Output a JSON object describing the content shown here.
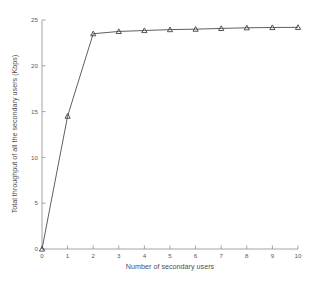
{
  "chart_data": {
    "type": "line",
    "title": "",
    "xlabel": "Number of secondary users",
    "ylabel": "Total throughput of all the secondary users (Kbps)",
    "x": [
      0,
      1,
      2,
      3,
      4,
      5,
      6,
      7,
      8,
      9,
      10
    ],
    "values": [
      0,
      14.5,
      23.5,
      23.75,
      23.85,
      23.95,
      24.0,
      24.08,
      24.15,
      24.18,
      24.2
    ],
    "series": [
      {
        "name": "Total throughput",
        "marker": "triangle",
        "color": "#53565c",
        "values": [
          0,
          14.5,
          23.5,
          23.75,
          23.85,
          23.95,
          24.0,
          24.08,
          24.15,
          24.18,
          24.2
        ]
      }
    ],
    "xlim": [
      0,
      10
    ],
    "ylim": [
      0,
      25
    ],
    "xticks": [
      "0",
      "1",
      "2",
      "3",
      "4",
      "5",
      "6",
      "7",
      "8",
      "9",
      "10"
    ],
    "yticks": [
      "0",
      "5",
      "10",
      "15",
      "20",
      "25"
    ],
    "grid": false,
    "legend": null,
    "legend_position": "none",
    "axis_color": "#9a9a9a",
    "background_color": "#ffffff"
  }
}
